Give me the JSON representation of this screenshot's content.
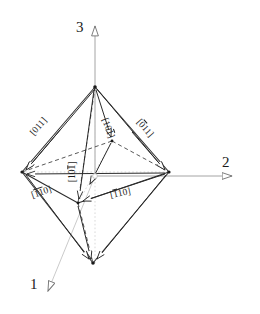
{
  "figure": {
    "shape": "octahedron",
    "line_color": "#2b2b2b",
    "axis_color": "#8a8a8a",
    "dotted_color": "#c2c2c2",
    "background": "#ffffff"
  },
  "axes": [
    {
      "id": "axis-1",
      "label": "1",
      "direction": "down-left",
      "arrowhead": "hollow-triangle"
    },
    {
      "id": "axis-2",
      "label": "2",
      "direction": "right",
      "arrowhead": "hollow-triangle"
    },
    {
      "id": "axis-3",
      "label": "3",
      "direction": "up",
      "arrowhead": "hollow-triangle"
    }
  ],
  "directions": [
    {
      "id": "dir-011",
      "text": "[011]",
      "bars": [],
      "digits": [
        "0",
        "1",
        "1"
      ],
      "rotation": -50
    },
    {
      "id": "dir-0bar11",
      "text": "[0̅1̅1]",
      "digits": [
        "0",
        "1",
        "1"
      ],
      "bars": [
        1
      ],
      "rotation": 52
    },
    {
      "id": "dir-10bar1",
      "text": "[10̅1]",
      "digits": [
        "1",
        "0",
        "1"
      ],
      "bars": [
        2
      ],
      "rotation": 64
    },
    {
      "id": "dir-10bar1-left",
      "text": "[10̅1]",
      "digits": [
        "1",
        "0",
        "1"
      ],
      "bars": [
        2
      ],
      "rotation": -90
    },
    {
      "id": "dir-bar1bar10",
      "text": "[̅1̅1 0]",
      "digits": [
        "1",
        "1",
        "0"
      ],
      "bars": [
        0,
        1
      ],
      "rotation": -22
    },
    {
      "id": "dir-bar110",
      "text": "[̅1 10]",
      "digits": [
        "1",
        "1",
        "0"
      ],
      "bars": [
        0
      ],
      "rotation": -14
    }
  ],
  "labels": {
    "axis1": "1",
    "axis2": "2",
    "axis3": "3",
    "d_011": {
      "d0": "0",
      "d1": "1",
      "d2": "1"
    },
    "d_0b11": {
      "d0": "0",
      "d1": "1",
      "d2": "1"
    },
    "d_10b1": {
      "d0": "1",
      "d1": "0",
      "d2": "1"
    },
    "d_10b1L": {
      "d0": "1",
      "d1": "0",
      "d2": "1"
    },
    "d_b1b10": {
      "d0": "1",
      "d1": "1",
      "d2": "0"
    },
    "d_b110": {
      "d0": "1",
      "d1": "1",
      "d2": "0"
    }
  },
  "vertices": {
    "top": [
      95,
      87
    ],
    "bottom": [
      93,
      263
    ],
    "left": [
      22,
      172
    ],
    "right": [
      169,
      172
    ],
    "front": [
      112,
      141
    ],
    "back": [
      78,
      203
    ]
  },
  "origin_marker": {
    "shape": "small-circle",
    "x": 95,
    "y": 176
  }
}
